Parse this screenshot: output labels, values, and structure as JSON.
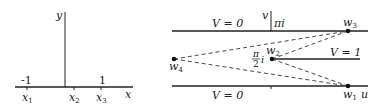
{
  "left_plane": {
    "axis_x_label": "x",
    "axis_y_label": "y",
    "tick_neg1": "-1",
    "tick_pos1": "1",
    "points": [
      {
        "name": "x",
        "sub": "1"
      },
      {
        "name": "x",
        "sub": "2"
      },
      {
        "name": "x",
        "sub": "3"
      }
    ]
  },
  "right_plane": {
    "axis_u_label": "u",
    "axis_v_label": "v",
    "top_line_label": "V = 0",
    "bottom_line_label": "V = 0",
    "middle_line_label": "V = 1",
    "top_value": "πi",
    "mid_value_num": "π",
    "mid_value_den": "2",
    "mid_value_suffix": "i",
    "points": [
      {
        "name": "w",
        "sub": "1"
      },
      {
        "name": "w",
        "sub": "2"
      },
      {
        "name": "w",
        "sub": "3"
      },
      {
        "name": "w",
        "sub": "4"
      }
    ]
  },
  "colors": {
    "line": "#222222",
    "background": "#ffffff"
  }
}
